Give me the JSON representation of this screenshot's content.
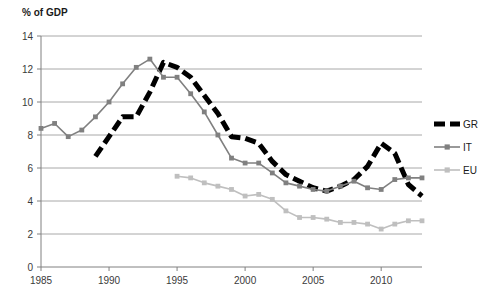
{
  "chart_data": {
    "type": "line",
    "title": "",
    "ylabel": "% of GDP",
    "xlabel": "",
    "ylim": [
      0,
      14
    ],
    "xlim": [
      1985,
      2013
    ],
    "yticks": [
      0,
      2,
      4,
      6,
      8,
      10,
      12,
      14
    ],
    "xticks": [
      1985,
      1990,
      1995,
      2000,
      2005,
      2010
    ],
    "grid": "horizontal",
    "legend_position": "right",
    "series": [
      {
        "name": "GR",
        "color": "#000000",
        "style": "dashed",
        "marker": "none",
        "x": [
          1989,
          1990,
          1991,
          1992,
          1993,
          1994,
          1995,
          1996,
          1997,
          1998,
          1999,
          2000,
          2001,
          2002,
          2003,
          2004,
          2005,
          2006,
          2007,
          2008,
          2009,
          2010,
          2011,
          2012,
          2013
        ],
        "values": [
          6.7,
          7.9,
          9.1,
          9.1,
          10.6,
          12.4,
          12.1,
          11.5,
          10.4,
          9.3,
          7.9,
          7.8,
          7.5,
          6.4,
          5.6,
          5.2,
          4.8,
          4.6,
          4.9,
          5.3,
          6.1,
          7.5,
          6.9,
          5.0,
          4.3
        ]
      },
      {
        "name": "IT",
        "color": "#808080",
        "style": "solid",
        "marker": "square",
        "x": [
          1985,
          1986,
          1987,
          1988,
          1989,
          1990,
          1991,
          1992,
          1993,
          1994,
          1995,
          1996,
          1997,
          1998,
          1999,
          2000,
          2001,
          2002,
          2003,
          2004,
          2005,
          2006,
          2007,
          2008,
          2009,
          2010,
          2011,
          2012,
          2013
        ],
        "values": [
          8.4,
          8.7,
          7.9,
          8.3,
          9.1,
          10.0,
          11.1,
          12.1,
          12.6,
          11.5,
          11.5,
          10.5,
          9.4,
          8.0,
          6.6,
          6.3,
          6.3,
          5.7,
          5.1,
          4.9,
          4.7,
          4.6,
          4.9,
          5.2,
          4.8,
          4.7,
          5.3,
          5.4,
          5.4
        ]
      },
      {
        "name": "EU",
        "color": "#bfbfbf",
        "style": "solid",
        "marker": "square",
        "x": [
          1995,
          1996,
          1997,
          1998,
          1999,
          2000,
          2001,
          2002,
          2003,
          2004,
          2005,
          2006,
          2007,
          2008,
          2009,
          2010,
          2011,
          2012,
          2013
        ],
        "values": [
          5.5,
          5.4,
          5.1,
          4.9,
          4.7,
          4.3,
          4.4,
          4.1,
          3.4,
          3.0,
          3.0,
          2.9,
          2.7,
          2.7,
          2.6,
          2.3,
          2.6,
          2.8,
          2.8
        ]
      }
    ]
  },
  "legend": {
    "entries": [
      {
        "label": "GR"
      },
      {
        "label": "IT"
      },
      {
        "label": "EU"
      }
    ]
  }
}
